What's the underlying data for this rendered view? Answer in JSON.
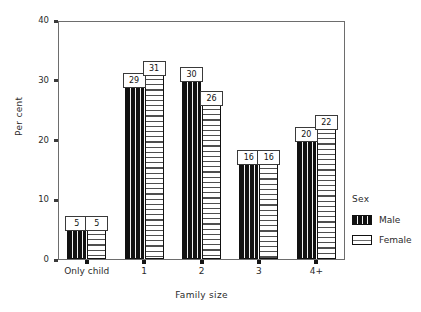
{
  "chart_data": {
    "type": "bar",
    "title": "",
    "subtitle": "",
    "xlabel": "Family size",
    "ylabel": "Per cent",
    "categories": [
      "Only child",
      "1",
      "2",
      "3",
      "4+"
    ],
    "series": [
      {
        "name": "Male",
        "values": [
          5,
          29,
          30,
          16,
          20
        ]
      },
      {
        "name": "Female",
        "values": [
          5,
          31,
          26,
          16,
          22
        ]
      }
    ],
    "value_labels": {
      "Male": [
        "5",
        "29",
        "30",
        "16",
        "20"
      ],
      "Female": [
        "5",
        "31",
        "26",
        "16",
        "22"
      ]
    },
    "ylim": [
      0,
      40
    ],
    "yticks": [
      0,
      10,
      20,
      30,
      40
    ],
    "ytick_labels": [
      "0",
      "10",
      "20",
      "30",
      "40"
    ],
    "grid": false,
    "legend": {
      "title": "Sex",
      "position": "right",
      "entries": [
        {
          "label": "Male",
          "pattern": "black-vertical-stripes"
        },
        {
          "label": "Female",
          "pattern": "white-horizontal-stripes"
        }
      ]
    },
    "colors": {
      "male_fill": "#111111",
      "female_fill": "#ffffff",
      "outline": "#111111",
      "axis": "#6d6d6d",
      "text": "#2b2b2b"
    }
  }
}
